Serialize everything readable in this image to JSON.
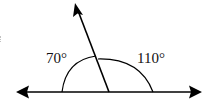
{
  "diagram": {
    "type": "angle-diagram",
    "line": {
      "style": "double-arrow",
      "color": "#000000"
    },
    "ray": {
      "style": "arrow",
      "color": "#000000"
    },
    "angles": [
      {
        "id": "left",
        "label": "70°",
        "value": 70
      },
      {
        "id": "right",
        "label": "110°",
        "value": 110
      }
    ],
    "stroke_color": "#000000",
    "background": "#ffffff"
  }
}
